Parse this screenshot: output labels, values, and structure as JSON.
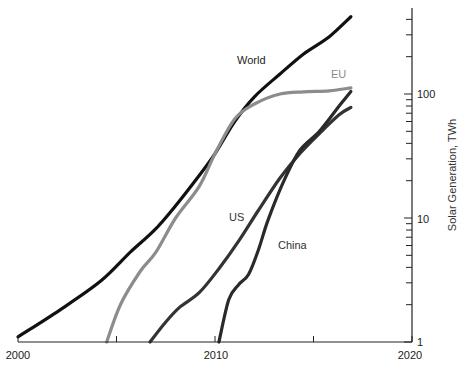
{
  "chart_data": {
    "type": "line",
    "title": "",
    "xlabel": "",
    "ylabel": "Solar Generation, TWh",
    "yscale": "log",
    "xlim": [
      2000,
      2020
    ],
    "ylim": [
      1,
      470
    ],
    "x_ticks": [
      2000,
      2010,
      2020
    ],
    "x_tick_labels": [
      "2000",
      "2010",
      "2020"
    ],
    "y_ticks": [
      1,
      10,
      100
    ],
    "y_tick_labels": [
      "1",
      "10",
      "100"
    ],
    "grid": false,
    "legend": "inline labels",
    "series": [
      {
        "name": "World",
        "color": "#111111",
        "x": [
          2000,
          2002.1,
          2004.2,
          2005.7,
          2006.9,
          2007.9,
          2009.2,
          2010.0,
          2011.0,
          2012.0,
          2013.3,
          2014.5,
          2015.8,
          2016.9
        ],
        "y": [
          1.1,
          1.8,
          3.1,
          5.3,
          7.9,
          12,
          22,
          33,
          60,
          95,
          145,
          210,
          290,
          420
        ]
      },
      {
        "name": "EU",
        "color": "#8c8c8c",
        "x": [
          2004.5,
          2005.2,
          2006.2,
          2007.0,
          2008.0,
          2009.2,
          2010.0,
          2011.0,
          2012.0,
          2013.3,
          2014.5,
          2015.8,
          2016.9
        ],
        "y": [
          1.0,
          2.0,
          3.7,
          5.3,
          10,
          18,
          33,
          63,
          83,
          100,
          104,
          106,
          112
        ]
      },
      {
        "name": "US",
        "color": "#333333",
        "x": [
          2006.7,
          2007.5,
          2008.2,
          2009.2,
          2010.2,
          2011.2,
          2012.2,
          2013.3,
          2014.3,
          2015.3,
          2016.3,
          2016.9
        ],
        "y": [
          1.0,
          1.45,
          1.9,
          2.5,
          3.9,
          6.5,
          11.5,
          21,
          33,
          48,
          68,
          78
        ]
      },
      {
        "name": "China",
        "color": "#2a2a2a",
        "x": [
          2010.2,
          2010.7,
          2011.2,
          2011.7,
          2012.2,
          2012.7,
          2013.5,
          2014.3,
          2015.3,
          2016.3,
          2016.9
        ],
        "y": [
          1.0,
          2.2,
          2.9,
          3.5,
          5.5,
          9.7,
          20,
          35,
          50,
          80,
          105
        ]
      }
    ]
  },
  "labels": {
    "world": "World",
    "eu": "EU",
    "us": "US",
    "china": "China",
    "x_2000": "2000",
    "x_2010": "2010",
    "x_2020": "2020",
    "y_1": "1",
    "y_10": "10",
    "y_100": "100",
    "ylabel": "Solar Generation, TWh"
  }
}
